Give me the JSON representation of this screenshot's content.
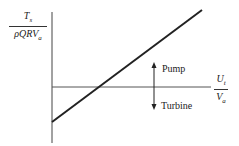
{
  "diagram": {
    "y_axis_label": {
      "numerator": "T",
      "numerator_sub": "s",
      "denominator": "ρQRV",
      "denominator_sub": "a"
    },
    "x_axis_label": {
      "numerator": "U",
      "numerator_sub": "t",
      "denominator": "V",
      "denominator_sub": "a"
    },
    "regions": {
      "above": "Pump",
      "below": "Turbine"
    },
    "line": {
      "x1": 52,
      "y1": 122,
      "x2": 202,
      "y2": 10
    },
    "colors": {
      "ink": "#222222",
      "axis": "#555555"
    }
  }
}
